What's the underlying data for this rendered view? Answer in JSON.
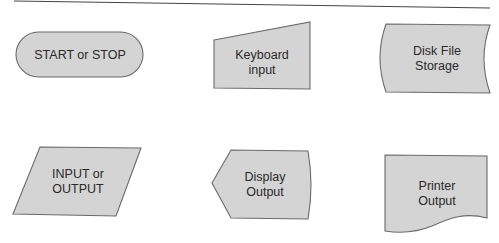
{
  "diagram": {
    "type": "flowchart-symbol-legend",
    "colors": {
      "fill": "#d4d4d4",
      "stroke": "#6a6a6a",
      "text": "#2a2a2a",
      "rule": "#444444"
    },
    "symbols": [
      {
        "id": "terminal",
        "shape": "stadium",
        "lines": [
          "START or STOP"
        ]
      },
      {
        "id": "keyboard",
        "shape": "manual-input",
        "lines": [
          "Keyboard",
          "input"
        ]
      },
      {
        "id": "disk",
        "shape": "stored-data",
        "lines": [
          "Disk File",
          "Storage"
        ]
      },
      {
        "id": "io",
        "shape": "parallelogram",
        "lines": [
          "INPUT or",
          "OUTPUT"
        ]
      },
      {
        "id": "display",
        "shape": "display",
        "lines": [
          "Display",
          "Output"
        ]
      },
      {
        "id": "printer",
        "shape": "document",
        "lines": [
          "Printer",
          "Output"
        ]
      }
    ]
  }
}
